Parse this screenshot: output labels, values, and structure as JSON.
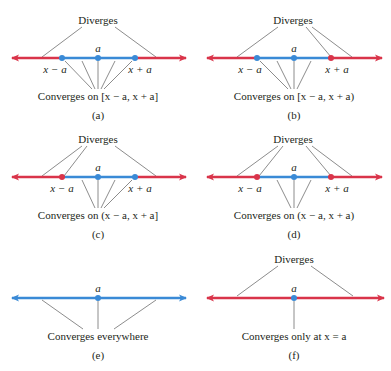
{
  "colors": {
    "diverge": "#d9344a",
    "converge": "#3a8ad6",
    "leader": "#6f6f6f",
    "text": "#231f20"
  },
  "panels": [
    {
      "id": "a",
      "caption": "(a)",
      "diverges_label": "Diverges",
      "center_label": "a",
      "left_label": "x − a",
      "right_label": "x + a",
      "converges_label": "Converges on [x − a, x + a]",
      "left_endpoint": "included",
      "right_endpoint": "included"
    },
    {
      "id": "b",
      "caption": "(b)",
      "diverges_label": "Diverges",
      "center_label": "a",
      "left_label": "x − a",
      "right_label": "x + a",
      "converges_label": "Converges on [x − a, x + a)",
      "left_endpoint": "included",
      "right_endpoint": "excluded"
    },
    {
      "id": "c",
      "caption": "(c)",
      "diverges_label": "Diverges",
      "center_label": "a",
      "left_label": "x − a",
      "right_label": "x + a",
      "converges_label": "Converges on (x − a, x + a]",
      "left_endpoint": "excluded",
      "right_endpoint": "included"
    },
    {
      "id": "d",
      "caption": "(d)",
      "diverges_label": "Diverges",
      "center_label": "a",
      "left_label": "x − a",
      "right_label": "x + a",
      "converges_label": "Converges on (x − a, x + a)",
      "left_endpoint": "excluded",
      "right_endpoint": "excluded"
    },
    {
      "id": "e",
      "caption": "(e)",
      "center_label": "a",
      "converges_label": "Converges everywhere"
    },
    {
      "id": "f",
      "caption": "(f)",
      "diverges_label": "Diverges",
      "center_label": "a",
      "converges_label": "Converges only at x = a"
    }
  ]
}
